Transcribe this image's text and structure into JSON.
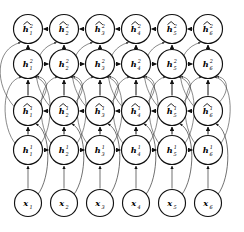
{
  "diagram": {
    "type": "directed-graph",
    "background_color": "#ffffff",
    "node_stroke_color": "#111111",
    "node_fill_color": "#ffffff",
    "edge_color": "#111111",
    "skip_edge_color": "#333333",
    "columns": 6,
    "rows": 5,
    "geometry": {
      "column_x": [
        28,
        64,
        100,
        136,
        172,
        208
      ],
      "row_y": [
        29,
        64,
        111,
        150,
        203
      ],
      "node_radius": 14.5,
      "input_node_radius": 13.5
    },
    "rows_meta": [
      {
        "id": "h2-hat",
        "symbol": "h",
        "hat": true,
        "superscript": "2",
        "direction": "backward",
        "arrow_direction": "left"
      },
      {
        "id": "h2",
        "symbol": "h",
        "hat": false,
        "superscript": "2",
        "direction": "forward",
        "arrow_direction": "right"
      },
      {
        "id": "h1-hat",
        "symbol": "h",
        "hat": true,
        "superscript": "1",
        "direction": "backward",
        "arrow_direction": "left"
      },
      {
        "id": "h1",
        "symbol": "h",
        "hat": false,
        "superscript": "1",
        "direction": "forward",
        "arrow_direction": "right"
      },
      {
        "id": "x",
        "symbol": "x",
        "hat": false,
        "superscript": "",
        "direction": "input",
        "arrow_direction": "none"
      }
    ],
    "nodes": [
      [
        {
          "base": "h",
          "hat": true,
          "sup": "2",
          "sub": "1"
        },
        {
          "base": "h",
          "hat": true,
          "sup": "2",
          "sub": "2"
        },
        {
          "base": "h",
          "hat": true,
          "sup": "2",
          "sub": "3"
        },
        {
          "base": "h",
          "hat": true,
          "sup": "2",
          "sub": "4"
        },
        {
          "base": "h",
          "hat": true,
          "sup": "2",
          "sub": "5"
        },
        {
          "base": "h",
          "hat": true,
          "sup": "2",
          "sub": "6"
        }
      ],
      [
        {
          "base": "h",
          "hat": false,
          "sup": "2",
          "sub": "1"
        },
        {
          "base": "h",
          "hat": false,
          "sup": "2",
          "sub": "2"
        },
        {
          "base": "h",
          "hat": false,
          "sup": "2",
          "sub": "3"
        },
        {
          "base": "h",
          "hat": false,
          "sup": "2",
          "sub": "4"
        },
        {
          "base": "h",
          "hat": false,
          "sup": "2",
          "sub": "5"
        },
        {
          "base": "h",
          "hat": false,
          "sup": "2",
          "sub": "6"
        }
      ],
      [
        {
          "base": "h",
          "hat": true,
          "sup": "1",
          "sub": "1"
        },
        {
          "base": "h",
          "hat": true,
          "sup": "1",
          "sub": "2"
        },
        {
          "base": "h",
          "hat": true,
          "sup": "1",
          "sub": "3"
        },
        {
          "base": "h",
          "hat": true,
          "sup": "1",
          "sub": "4"
        },
        {
          "base": "h",
          "hat": true,
          "sup": "1",
          "sub": "5"
        },
        {
          "base": "h",
          "hat": true,
          "sup": "1",
          "sub": "6"
        }
      ],
      [
        {
          "base": "h",
          "hat": false,
          "sup": "1",
          "sub": "1"
        },
        {
          "base": "h",
          "hat": false,
          "sup": "1",
          "sub": "2"
        },
        {
          "base": "h",
          "hat": false,
          "sup": "1",
          "sub": "3"
        },
        {
          "base": "h",
          "hat": false,
          "sup": "1",
          "sub": "4"
        },
        {
          "base": "h",
          "hat": false,
          "sup": "1",
          "sub": "5"
        },
        {
          "base": "h",
          "hat": false,
          "sup": "1",
          "sub": "6"
        }
      ],
      [
        {
          "base": "x",
          "hat": false,
          "sup": "",
          "sub": "1"
        },
        {
          "base": "x",
          "hat": false,
          "sup": "",
          "sub": "2"
        },
        {
          "base": "x",
          "hat": false,
          "sup": "",
          "sub": "3"
        },
        {
          "base": "x",
          "hat": false,
          "sup": "",
          "sub": "4"
        },
        {
          "base": "x",
          "hat": false,
          "sup": "",
          "sub": "5"
        },
        {
          "base": "x",
          "hat": false,
          "sup": "",
          "sub": "6"
        }
      ]
    ]
  }
}
